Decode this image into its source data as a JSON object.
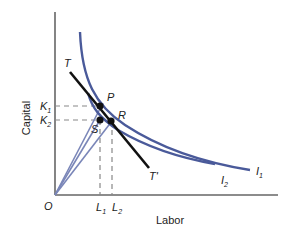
{
  "diagram": {
    "axes": {
      "y_label": "Capital",
      "x_label": "Labor",
      "origin": "O",
      "color": "#666666"
    },
    "ticks": {
      "k1": {
        "main": "K",
        "sub": "1"
      },
      "k2": {
        "main": "K",
        "sub": "2"
      },
      "l1": {
        "main": "L",
        "sub": "1"
      },
      "l2": {
        "main": "L",
        "sub": "2"
      }
    },
    "isoquants": [
      {
        "name": "I",
        "sub": "1",
        "color": "#4a5a9a"
      },
      {
        "name": "I",
        "sub": "2",
        "color": "#4a5a9a"
      }
    ],
    "tangent_line": {
      "start_label": "T",
      "end_label": "T'",
      "color": "#111111"
    },
    "points": [
      {
        "label": "P"
      },
      {
        "label": "R"
      },
      {
        "label": "S"
      }
    ],
    "rays_color": "#7a86b8",
    "dash_color": "#888888"
  }
}
